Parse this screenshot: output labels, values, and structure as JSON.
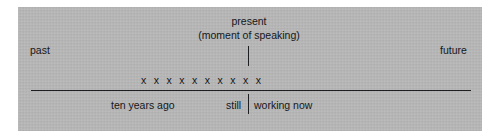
{
  "figure": {
    "type": "timeline-diagram",
    "background_color": "#b7b7b7",
    "ink_color": "#15171a",
    "page_color": "#ffffff",
    "axis": {
      "label_left": "past",
      "label_right": "future"
    },
    "present_marker": {
      "line1": "present",
      "line2": "(moment of speaking)"
    },
    "duration_marks": {
      "glyph": "x",
      "count": 10,
      "marks": [
        "x",
        "x",
        "x",
        "x",
        "x",
        "x",
        "x",
        "x",
        "x",
        "x"
      ]
    },
    "annotations": {
      "start": "ten years ago",
      "adverb": "still",
      "predicate": "working now"
    }
  }
}
